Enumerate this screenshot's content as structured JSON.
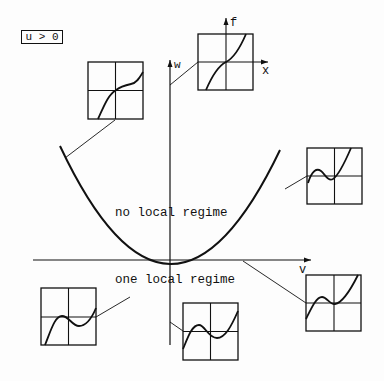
{
  "condition_label": "u > 0",
  "axes": {
    "horizontal_label": "v",
    "vertical_label": "w",
    "inset_axis_x_label": "x",
    "inset_axis_f_label": "f"
  },
  "regions": {
    "above": "no local regime",
    "below": "one local regime"
  },
  "insets": [
    {
      "id": "top-left",
      "shape": "monotone-with-inflection-plateau"
    },
    {
      "id": "top-right",
      "shape": "monotone-increasing"
    },
    {
      "id": "right-middle",
      "shape": "cubic-with-local-extrema"
    },
    {
      "id": "right-bottom",
      "shape": "cubic-with-local-extrema"
    },
    {
      "id": "bottom-left",
      "shape": "cubic-with-local-extrema"
    },
    {
      "id": "bottom-center",
      "shape": "cubic-with-local-extrema"
    }
  ]
}
